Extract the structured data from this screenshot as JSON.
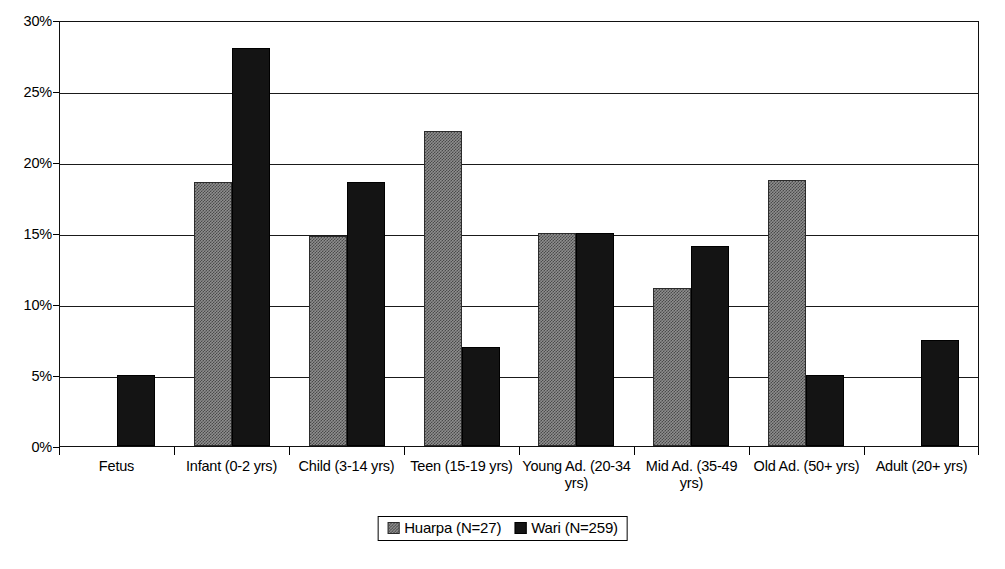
{
  "chart_data": {
    "type": "bar",
    "title": "",
    "subtitle": "",
    "xlabel": "",
    "ylabel": "",
    "ylim": [
      0,
      30
    ],
    "y_tick_labels": [
      "0%",
      "5%",
      "10%",
      "15%",
      "20%",
      "25%",
      "30%"
    ],
    "y_tick_values": [
      0,
      5,
      10,
      15,
      20,
      25,
      30
    ],
    "grid": true,
    "legend_position": "bottom-center",
    "categories": [
      "Fetus",
      "Infant (0-2 yrs)",
      "Child (3-14 yrs)",
      "Teen (15-19 yrs)",
      "Young Ad. (20-34 yrs)",
      "Mid Ad. (35-49 yrs)",
      "Old Ad. (50+ yrs)",
      "Adult (20+ yrs)"
    ],
    "series": [
      {
        "name": "Huarpa (N=27)",
        "color": "#8e8e8e",
        "fill": "dithered-gray",
        "values": [
          null,
          18.6,
          14.8,
          22.2,
          15.0,
          11.1,
          18.7,
          null
        ]
      },
      {
        "name": "Wari (N=259)",
        "color": "#141414",
        "fill": "solid-black",
        "values": [
          5.0,
          28.0,
          18.6,
          7.0,
          15.0,
          14.1,
          5.0,
          7.5
        ]
      }
    ]
  },
  "legend": {
    "entries": [
      {
        "label": "Huarpa (N=27)",
        "swatch": "dithered-gray-swatch"
      },
      {
        "label": "Wari (N=259)",
        "swatch": "solid-black-swatch"
      }
    ]
  }
}
